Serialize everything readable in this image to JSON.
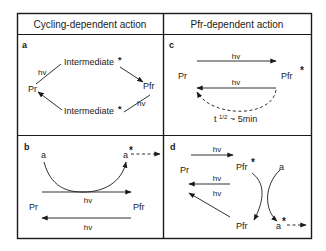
{
  "headers": {
    "left": "Cycling-dependent action",
    "right": "Pfr-dependent action"
  },
  "panels": {
    "a": {
      "label": "a",
      "pr": "Pr",
      "pfr": "Pfr",
      "intermediate_top": "Intermediate",
      "intermediate_bottom": "Intermediate",
      "star": "*",
      "hv_left": "hv",
      "hv_right": "hv"
    },
    "b": {
      "label": "b",
      "a": "a",
      "a_star": "a",
      "star": "*",
      "hv_top": "hv",
      "hv_bottom": "hv",
      "pr": "Pr",
      "pfr": "Pfr"
    },
    "c": {
      "label": "c",
      "pr": "Pr",
      "pfr": "Pfr",
      "star": "*",
      "hv_top": "hv",
      "hv_bottom": "hv",
      "half_life_t": "t",
      "half_life_frac": "1/2",
      "half_life_value": "~ 5min"
    },
    "d": {
      "label": "d",
      "pr": "Pr",
      "pfr_star": "Pfr",
      "pfr": "Pfr",
      "a": "a",
      "a_star": "a",
      "star": "*",
      "hv_1": "hv",
      "hv_2": "hv",
      "hv_3": "hv"
    }
  },
  "colors": {
    "ink": "#1a1a1a",
    "background": "#ffffff"
  }
}
